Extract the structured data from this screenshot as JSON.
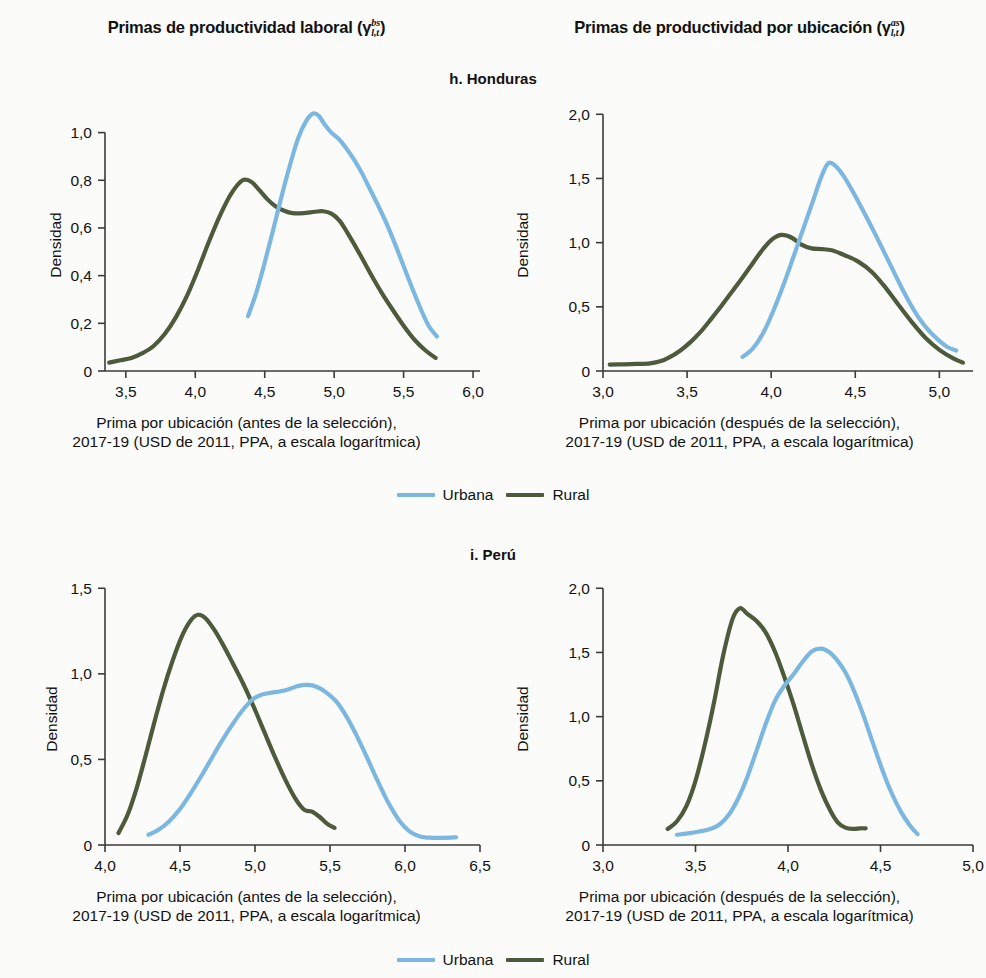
{
  "figure": {
    "column_titles": {
      "left": {
        "text": "Primas de productividad laboral (γ",
        "sup": "bs",
        "sub": "l,t",
        "close": ")"
      },
      "right": {
        "text": "Primas de productividad por ubicación (γ",
        "sup": "as",
        "sub": "l,t",
        "close": ")"
      }
    },
    "panel_titles": {
      "honduras": "h. Honduras",
      "peru": "i. Perú"
    },
    "legend": {
      "urbana_label": "Urbana",
      "rural_label": "Rural",
      "urbana_color": "#7CB7E0",
      "rural_color": "#4D5B3C"
    },
    "captions": {
      "before": {
        "line1": "Prima por ubicación (antes de la selección),",
        "line2": "2017-19 (USD de 2011, PPA, a escala logarítmica)"
      },
      "after": {
        "line1": "Prima por ubicación (después de la selección),",
        "line2": "2017-19 (USD de 2011, PPA, a escala logarítmica)"
      }
    },
    "ylabel": "Densidad"
  },
  "chart_data": [
    {
      "id": "honduras-before",
      "type": "line",
      "title": "h. Honduras",
      "subtitle": "Primas de productividad laboral",
      "xlabel": "Prima por ubicación (antes de la selección), 2017-19 (USD de 2011, PPA, a escala logarítmica)",
      "ylabel": "Densidad",
      "xlim": [
        3.35,
        6.05
      ],
      "ylim": [
        0,
        1.12
      ],
      "xticks": [
        3.5,
        4.0,
        4.5,
        5.0,
        5.5,
        6.0
      ],
      "xticklabels": [
        "3,5",
        "4,0",
        "4,5",
        "5,0",
        "5,5",
        "6,0"
      ],
      "yticks": [
        0,
        0.2,
        0.4,
        0.6,
        0.8,
        1.0
      ],
      "yticklabels": [
        "0",
        "0,2",
        "0,4",
        "0,6",
        "0,8",
        "1,0"
      ],
      "grid": false,
      "legend_position": "below",
      "series": [
        {
          "name": "Rural",
          "color": "#4D5B3C",
          "x": [
            3.38,
            3.46,
            3.54,
            3.62,
            3.7,
            3.78,
            3.86,
            3.94,
            4.02,
            4.1,
            4.18,
            4.26,
            4.34,
            4.4,
            4.46,
            4.52,
            4.58,
            4.64,
            4.7,
            4.78,
            4.86,
            4.92,
            4.98,
            5.04,
            5.1,
            5.18,
            5.26,
            5.34,
            5.42,
            5.5,
            5.58,
            5.66,
            5.73
          ],
          "y": [
            0.035,
            0.045,
            0.055,
            0.075,
            0.105,
            0.155,
            0.225,
            0.315,
            0.425,
            0.545,
            0.655,
            0.745,
            0.8,
            0.795,
            0.76,
            0.72,
            0.69,
            0.672,
            0.662,
            0.662,
            0.668,
            0.67,
            0.66,
            0.63,
            0.575,
            0.495,
            0.41,
            0.33,
            0.258,
            0.19,
            0.13,
            0.085,
            0.055
          ]
        },
        {
          "name": "Urbana",
          "color": "#7CB7E0",
          "x": [
            4.38,
            4.44,
            4.5,
            4.56,
            4.62,
            4.68,
            4.74,
            4.8,
            4.85,
            4.89,
            4.93,
            4.98,
            5.03,
            5.08,
            5.14,
            5.2,
            5.26,
            5.32,
            5.38,
            5.44,
            5.5,
            5.56,
            5.62,
            5.68,
            5.74
          ],
          "y": [
            0.23,
            0.33,
            0.455,
            0.59,
            0.73,
            0.86,
            0.975,
            1.05,
            1.08,
            1.07,
            1.035,
            1.0,
            0.975,
            0.94,
            0.89,
            0.83,
            0.76,
            0.69,
            0.615,
            0.53,
            0.44,
            0.35,
            0.265,
            0.19,
            0.145
          ]
        }
      ]
    },
    {
      "id": "honduras-after",
      "type": "line",
      "title": "h. Honduras",
      "subtitle": "Primas de productividad por ubicación",
      "xlabel": "Prima por ubicación (después de la selección), 2017-19 (USD de 2011, PPA, a escala logarítmica)",
      "ylabel": "Densidad",
      "xlim": [
        3.0,
        5.2
      ],
      "ylim": [
        0,
        2.08
      ],
      "xticks": [
        3.0,
        3.5,
        4.0,
        4.5,
        5.0
      ],
      "xticklabels": [
        "3,0",
        "3,5",
        "4,0",
        "4,5",
        "5,0"
      ],
      "yticks": [
        0,
        0.5,
        1.0,
        1.5,
        2.0
      ],
      "yticklabels": [
        "0",
        "0,5",
        "1,0",
        "1,5",
        "2,0"
      ],
      "grid": false,
      "legend_position": "below",
      "series": [
        {
          "name": "Rural",
          "color": "#4D5B3C",
          "x": [
            3.04,
            3.12,
            3.2,
            3.28,
            3.34,
            3.4,
            3.46,
            3.52,
            3.58,
            3.64,
            3.7,
            3.76,
            3.82,
            3.88,
            3.94,
            4.0,
            4.06,
            4.12,
            4.18,
            4.24,
            4.3,
            4.36,
            4.44,
            4.52,
            4.6,
            4.68,
            4.76,
            4.84,
            4.92,
            5.0,
            5.08,
            5.14
          ],
          "y": [
            0.05,
            0.052,
            0.055,
            0.06,
            0.075,
            0.11,
            0.16,
            0.225,
            0.305,
            0.4,
            0.5,
            0.605,
            0.71,
            0.82,
            0.93,
            1.02,
            1.06,
            1.04,
            0.985,
            0.955,
            0.95,
            0.94,
            0.9,
            0.85,
            0.77,
            0.65,
            0.51,
            0.375,
            0.255,
            0.165,
            0.1,
            0.065
          ]
        },
        {
          "name": "Urbana",
          "color": "#7CB7E0",
          "x": [
            3.83,
            3.89,
            3.95,
            4.01,
            4.07,
            4.13,
            4.19,
            4.25,
            4.3,
            4.34,
            4.38,
            4.43,
            4.48,
            4.53,
            4.58,
            4.64,
            4.7,
            4.76,
            4.82,
            4.88,
            4.94,
            5.0,
            5.05,
            5.1
          ],
          "y": [
            0.11,
            0.175,
            0.29,
            0.46,
            0.66,
            0.88,
            1.105,
            1.33,
            1.52,
            1.62,
            1.6,
            1.52,
            1.41,
            1.29,
            1.165,
            1.01,
            0.85,
            0.69,
            0.54,
            0.41,
            0.31,
            0.235,
            0.185,
            0.16
          ]
        }
      ]
    },
    {
      "id": "peru-before",
      "type": "line",
      "title": "i. Perú",
      "subtitle": "Primas de productividad laboral",
      "xlabel": "Prima por ubicación (antes de la selección), 2017-19 (USD de 2011, PPA, a escala logarítmica)",
      "ylabel": "Densidad",
      "xlim": [
        4.0,
        6.5
      ],
      "ylim": [
        0,
        1.56
      ],
      "xticks": [
        4.0,
        4.5,
        5.0,
        5.5,
        6.0,
        6.5
      ],
      "xticklabels": [
        "4,0",
        "4,5",
        "5,0",
        "5,5",
        "6,0",
        "6,5"
      ],
      "yticks": [
        0,
        0.5,
        1.0,
        1.5
      ],
      "yticklabels": [
        "0",
        "0,5",
        "1,0",
        "1,5"
      ],
      "grid": false,
      "legend_position": "below",
      "series": [
        {
          "name": "Rural",
          "color": "#4D5B3C",
          "x": [
            4.09,
            4.15,
            4.21,
            4.27,
            4.33,
            4.39,
            4.45,
            4.51,
            4.57,
            4.62,
            4.67,
            4.73,
            4.79,
            4.85,
            4.92,
            4.99,
            5.06,
            5.13,
            5.2,
            5.27,
            5.33,
            5.38,
            5.43,
            5.48,
            5.53
          ],
          "y": [
            0.07,
            0.175,
            0.33,
            0.52,
            0.72,
            0.91,
            1.075,
            1.215,
            1.31,
            1.345,
            1.325,
            1.255,
            1.165,
            1.065,
            0.945,
            0.81,
            0.665,
            0.52,
            0.385,
            0.27,
            0.205,
            0.195,
            0.165,
            0.125,
            0.1
          ]
        },
        {
          "name": "Urbana",
          "color": "#7CB7E0",
          "x": [
            4.29,
            4.36,
            4.43,
            4.5,
            4.57,
            4.64,
            4.71,
            4.78,
            4.85,
            4.92,
            4.99,
            5.05,
            5.11,
            5.17,
            5.23,
            5.29,
            5.35,
            5.41,
            5.47,
            5.54,
            5.61,
            5.68,
            5.75,
            5.82,
            5.89,
            5.96,
            6.03,
            6.1,
            6.18,
            6.26,
            6.34
          ],
          "y": [
            0.06,
            0.09,
            0.14,
            0.21,
            0.3,
            0.4,
            0.505,
            0.61,
            0.705,
            0.79,
            0.855,
            0.88,
            0.89,
            0.898,
            0.912,
            0.93,
            0.935,
            0.925,
            0.895,
            0.84,
            0.75,
            0.635,
            0.505,
            0.37,
            0.245,
            0.145,
            0.08,
            0.05,
            0.042,
            0.042,
            0.045
          ]
        }
      ]
    },
    {
      "id": "peru-after",
      "type": "line",
      "title": "i. Perú",
      "subtitle": "Primas de productividad por ubicación",
      "xlabel": "Prima por ubicación (después de la selección), 2017-19 (USD de 2011, PPA, a escala logarítmica)",
      "ylabel": "Densidad",
      "xlim": [
        3.0,
        5.0
      ],
      "ylim": [
        0,
        2.08
      ],
      "xticks": [
        3.0,
        3.5,
        4.0,
        4.5,
        5.0
      ],
      "xticklabels": [
        "3,0",
        "3,5",
        "4,0",
        "4,5",
        "5,0"
      ],
      "yticks": [
        0,
        0.5,
        1.0,
        1.5,
        2.0
      ],
      "yticklabels": [
        "0",
        "0,5",
        "1,0",
        "1,5",
        "2,0"
      ],
      "grid": false,
      "legend_position": "below",
      "series": [
        {
          "name": "Rural",
          "color": "#4D5B3C",
          "x": [
            3.35,
            3.4,
            3.45,
            3.5,
            3.55,
            3.6,
            3.65,
            3.7,
            3.74,
            3.78,
            3.83,
            3.88,
            3.93,
            3.98,
            4.03,
            4.08,
            4.13,
            4.18,
            4.23,
            4.27,
            4.31,
            4.35,
            4.39,
            4.42
          ],
          "y": [
            0.125,
            0.185,
            0.3,
            0.5,
            0.78,
            1.11,
            1.48,
            1.76,
            1.845,
            1.8,
            1.745,
            1.655,
            1.505,
            1.31,
            1.095,
            0.855,
            0.62,
            0.42,
            0.265,
            0.175,
            0.135,
            0.125,
            0.13,
            0.13
          ]
        },
        {
          "name": "Urbana",
          "color": "#7CB7E0",
          "x": [
            3.4,
            3.46,
            3.52,
            3.58,
            3.63,
            3.68,
            3.73,
            3.78,
            3.83,
            3.88,
            3.93,
            3.98,
            4.03,
            4.08,
            4.13,
            4.18,
            4.22,
            4.26,
            4.31,
            4.36,
            4.41,
            4.46,
            4.51,
            4.56,
            4.61,
            4.66,
            4.7
          ],
          "y": [
            0.08,
            0.09,
            0.105,
            0.125,
            0.16,
            0.235,
            0.36,
            0.53,
            0.735,
            0.945,
            1.125,
            1.24,
            1.33,
            1.43,
            1.51,
            1.53,
            1.505,
            1.45,
            1.345,
            1.19,
            1.0,
            0.79,
            0.585,
            0.405,
            0.26,
            0.15,
            0.085
          ]
        }
      ]
    }
  ]
}
